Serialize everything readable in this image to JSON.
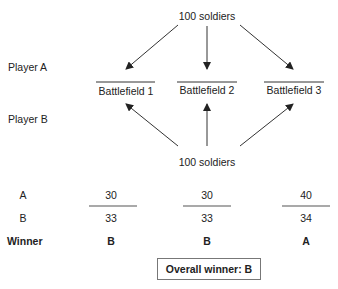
{
  "top_source": "100 soldiers",
  "bottom_source": "100 soldiers",
  "row_labels": {
    "player_a": "Player A",
    "player_b": "Player B"
  },
  "battlefields": [
    "Battlefield 1",
    "Battlefield 2",
    "Battlefield 3"
  ],
  "table": {
    "row_a_label": "A",
    "row_b_label": "B",
    "winner_label": "Winner",
    "a_values": [
      "30",
      "30",
      "40"
    ],
    "b_values": [
      "33",
      "33",
      "34"
    ],
    "winners": [
      "B",
      "B",
      "A"
    ]
  },
  "overall_winner": "Overall winner: B"
}
